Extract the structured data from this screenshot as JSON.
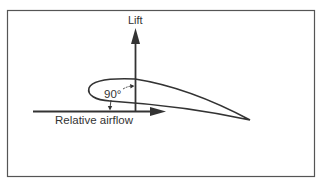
{
  "diagram": {
    "labels": {
      "lift": "Lift",
      "angle": "90°",
      "relative_airflow": "Relative airflow"
    },
    "colors": {
      "stroke": "#333333",
      "frame": "#555555",
      "background": "#ffffff"
    },
    "elements": [
      {
        "type": "frame",
        "description": "Rectangular border around the diagram"
      },
      {
        "type": "airfoil",
        "description": "Wing cross-section with rounded leading edge and pointed trailing edge"
      },
      {
        "type": "arrow",
        "direction": "up",
        "label": "Lift"
      },
      {
        "type": "arrow",
        "direction": "right",
        "label": "Relative airflow"
      },
      {
        "type": "angle-marker",
        "label": "90°",
        "description": "Right angle between lift and relative airflow"
      }
    ]
  }
}
